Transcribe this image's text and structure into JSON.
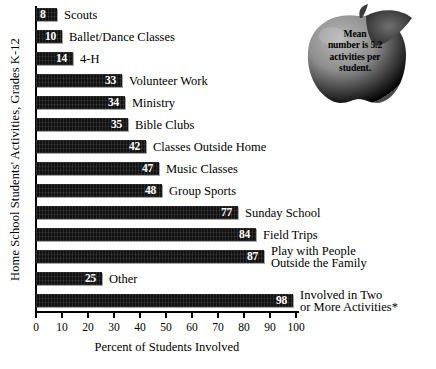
{
  "chart_data": {
    "type": "bar",
    "orientation": "horizontal",
    "title": "",
    "xlabel": "Percent of Students Involved",
    "ylabel": "Home School Students' Activities, Grades K-12",
    "xlim": [
      0,
      100
    ],
    "xticks": [
      0,
      10,
      20,
      30,
      40,
      50,
      60,
      70,
      80,
      90,
      100
    ],
    "xtick_labels": [
      "0",
      "10",
      "20",
      "30",
      "40",
      "50",
      "60",
      "70",
      "80",
      "90",
      "100"
    ],
    "grid": false,
    "legend": false,
    "categories": [
      "Scouts",
      "Ballet/Dance Classes",
      "4-H",
      "Volunteer Work",
      "Ministry",
      "Bible Clubs",
      "Classes Outside Home",
      "Music Classes",
      "Group Sports",
      "Sunday School",
      "Field Trips",
      "Play with People Outside the Family",
      "Other",
      "Involved in Two or More Activities*"
    ],
    "values": [
      8,
      10,
      14,
      33,
      34,
      35,
      42,
      47,
      48,
      77,
      84,
      87,
      25,
      98
    ],
    "bars": [
      {
        "label": "Scouts",
        "label_lines": [
          "Scouts"
        ],
        "value": 8
      },
      {
        "label": "Ballet/Dance Classes",
        "label_lines": [
          "Ballet/Dance Classes"
        ],
        "value": 10
      },
      {
        "label": "4-H",
        "label_lines": [
          "4-H"
        ],
        "value": 14
      },
      {
        "label": "Volunteer Work",
        "label_lines": [
          "Volunteer Work"
        ],
        "value": 33
      },
      {
        "label": "Ministry",
        "label_lines": [
          "Ministry"
        ],
        "value": 34
      },
      {
        "label": "Bible Clubs",
        "label_lines": [
          "Bible Clubs"
        ],
        "value": 35
      },
      {
        "label": "Classes Outside Home",
        "label_lines": [
          "Classes Outside Home"
        ],
        "value": 42
      },
      {
        "label": "Music Classes",
        "label_lines": [
          "Music Classes"
        ],
        "value": 47
      },
      {
        "label": "Group Sports",
        "label_lines": [
          "Group Sports"
        ],
        "value": 48
      },
      {
        "label": "Sunday School",
        "label_lines": [
          "Sunday School"
        ],
        "value": 77
      },
      {
        "label": "Field Trips",
        "label_lines": [
          "Field Trips"
        ],
        "value": 84
      },
      {
        "label": "Play with People Outside the Family",
        "label_lines": [
          "Play with People",
          "Outside the Family"
        ],
        "value": 87
      },
      {
        "label": "Other",
        "label_lines": [
          "Other"
        ],
        "value": 25
      },
      {
        "label": "Involved in Two or More Activities*",
        "label_lines": [
          "Involved in Two",
          "or More Activities*"
        ],
        "value": 98
      }
    ],
    "annotation": {
      "text": "Mean number is 5.2 activities per student.",
      "lines": [
        "Mean",
        "number is 5.2",
        "activities per",
        "student."
      ],
      "graphic": "apple-illustration",
      "position": "top-right"
    },
    "colors": {
      "bar": "#111111",
      "bar_value_text": "#ffffff",
      "category_text": "#000000",
      "axis": "#000000",
      "background": "#ffffff"
    }
  },
  "bar_labels": {
    "b0": "8",
    "b1": "10",
    "b2": "14",
    "b3": "33",
    "b4": "34",
    "b5": "35",
    "b6": "42",
    "b7": "47",
    "b8": "48",
    "b9": "77",
    "b10": "84",
    "b11": "87",
    "b12": "25",
    "b13": "98"
  },
  "cat_labels": {
    "c0": "Scouts",
    "c1": "Ballet/Dance Classes",
    "c2": "4-H",
    "c3": "Volunteer Work",
    "c4": "Ministry",
    "c5": "Bible Clubs",
    "c6": "Classes Outside Home",
    "c7": "Music Classes",
    "c8": "Group Sports",
    "c9": "Sunday School",
    "c10": "Field Trips",
    "c11a": "Play with People",
    "c11b": "Outside the Family",
    "c12": "Other",
    "c13a": "Involved in Two",
    "c13b": "or More Activities*"
  },
  "axis": {
    "y_title": "Home School Students' Activities, Grades K-12",
    "x_title": "Percent of Students Involved",
    "t0": "0",
    "t1": "10",
    "t2": "20",
    "t3": "30",
    "t4": "40",
    "t5": "50",
    "t6": "60",
    "t7": "70",
    "t8": "80",
    "t9": "90",
    "t10": "100"
  },
  "annotation": {
    "line1": "Mean",
    "line2": "number is 5.2",
    "line3": "activities per",
    "line4": "student."
  }
}
